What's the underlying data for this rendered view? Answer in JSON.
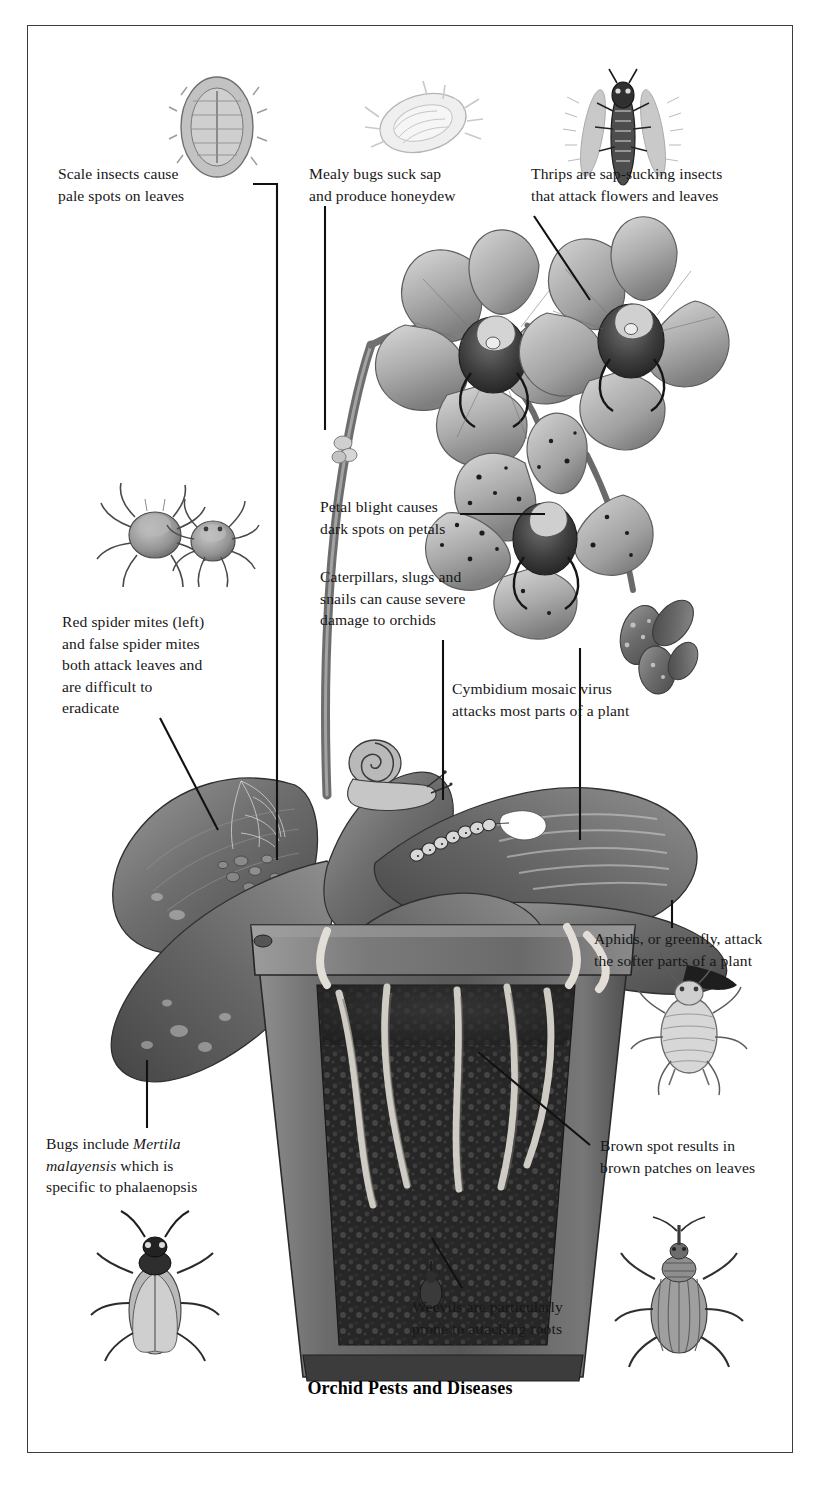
{
  "figure": {
    "title": "Orchid Pests and Diseases",
    "medium": "grayscale pencil illustration",
    "border_color": "#3d3d3d",
    "background_color": "#ffffff",
    "text_color": "#171717"
  },
  "callouts": [
    {
      "id": "scale-insects",
      "text": "Scale insects cause\npale spots on leaves",
      "x": 58,
      "y": 163,
      "align": "left",
      "specimen": "scale-insect"
    },
    {
      "id": "mealy-bugs",
      "text": "Mealy bugs suck sap\nand produce honeydew",
      "x": 309,
      "y": 163,
      "align": "left",
      "specimen": "mealy-bug"
    },
    {
      "id": "thrips",
      "text": "Thrips are sap-sucking insects\nthat attack flowers and leaves",
      "x": 531,
      "y": 163,
      "align": "left",
      "specimen": "thrips"
    },
    {
      "id": "petal-blight",
      "text": "Petal blight causes\ndark spots on petals",
      "x": 320,
      "y": 496,
      "align": "left",
      "specimen": null
    },
    {
      "id": "caterpillars-slugs-snails",
      "text": "Caterpillars, slugs and\nsnails can cause severe\ndamage to orchids",
      "x": 320,
      "y": 566,
      "align": "left",
      "specimen": null
    },
    {
      "id": "red-spider-mites",
      "text": "Red spider mites (left)\nand false spider mites\nboth attack leaves and\nare difficult to\neradicate",
      "x": 62,
      "y": 611,
      "align": "left",
      "specimen": "spider-mites"
    },
    {
      "id": "cymbidium-mosaic-virus",
      "text": "Cymbidium mosaic virus\nattacks most parts of a plant",
      "x": 452,
      "y": 678,
      "align": "left",
      "specimen": null
    },
    {
      "id": "aphids",
      "text": "Aphids, or greenfly, attack\nthe softer parts of a plant",
      "x": 594,
      "y": 928,
      "align": "left",
      "specimen": "aphid"
    },
    {
      "id": "bugs-mertila",
      "text": "Bugs include Mertila\nmalayensis which is\nspecific to phalaenopsis",
      "italic_part": "Mertila malayensis",
      "x": 46,
      "y": 1133,
      "align": "left",
      "specimen": "bug-beetle"
    },
    {
      "id": "brown-spot",
      "text": "Brown spot results in\nbrown patches on leaves",
      "x": 600,
      "y": 1135,
      "align": "left",
      "specimen": null
    },
    {
      "id": "weevils",
      "text": "Weevils are particularly\nprone to attacking roots",
      "x": 412,
      "y": 1296,
      "align": "left",
      "specimen": "weevil"
    }
  ],
  "specimens": [
    {
      "id": "scale-insect",
      "label": "scale insect specimen",
      "x": 152,
      "y": 50,
      "w": 76,
      "h": 104
    },
    {
      "id": "mealy-bug",
      "label": "mealy bug specimen",
      "x": 350,
      "y": 55,
      "w": 88,
      "h": 90
    },
    {
      "id": "thrips",
      "label": "thrips specimen",
      "x": 555,
      "y": 45,
      "w": 88,
      "h": 110
    },
    {
      "id": "spider-mites",
      "label": "red and false spider mites",
      "x": 95,
      "y": 480,
      "w": 130,
      "h": 100
    },
    {
      "id": "aphid",
      "label": "aphid greenfly specimen",
      "x": 615,
      "y": 955,
      "w": 90,
      "h": 110
    },
    {
      "id": "bug-beetle",
      "label": "mertila bug specimen",
      "x": 70,
      "y": 1215,
      "w": 120,
      "h": 115
    },
    {
      "id": "weevil",
      "label": "weevil specimen",
      "x": 615,
      "y": 1215,
      "w": 110,
      "h": 115
    }
  ],
  "plant": {
    "name": "phalaenopsis orchid in terracotta pot",
    "flowers": 3,
    "leaves": 5,
    "pests_on_plant": [
      "snail",
      "caterpillar",
      "slug",
      "brown-spot-lesion",
      "scale-colony",
      "spider-mite-webbing"
    ]
  }
}
